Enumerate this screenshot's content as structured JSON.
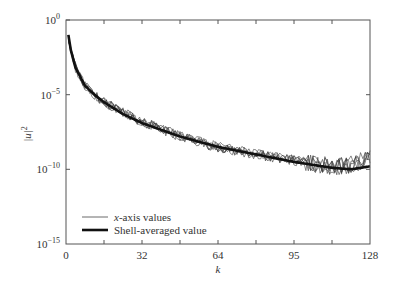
{
  "chart_data": {
    "type": "line",
    "title": "",
    "xlabel": "k",
    "ylabel": "|u|^2",
    "xlim": [
      0,
      128
    ],
    "ylim_log10": [
      -15,
      0
    ],
    "y_scale": "log",
    "grid": false,
    "legend_position": "lower left",
    "x_ticks": [
      0,
      32,
      64,
      95,
      128
    ],
    "x_tick_labels": [
      "0",
      "32",
      "64",
      "95",
      "128"
    ],
    "y_ticks_log10": [
      0,
      -5,
      -10,
      -15
    ],
    "y_tick_labels": [
      "10^0",
      "10^-5",
      "10^-10",
      "10^-15"
    ],
    "series": [
      {
        "name": "x-axis values",
        "style": "thin noisy lines (multiple realizations)",
        "k": [
          1,
          2,
          4,
          8,
          12,
          16,
          24,
          32,
          48,
          64,
          80,
          96,
          112,
          120,
          128
        ],
        "log10_value": [
          -1.2,
          -2.0,
          -3.2,
          -4.4,
          -5.0,
          -5.5,
          -6.2,
          -6.8,
          -7.8,
          -8.5,
          -9.0,
          -9.4,
          -9.8,
          -9.7,
          -9.2
        ]
      },
      {
        "name": "Shell-averaged value",
        "style": "thick line",
        "k": [
          1,
          2,
          4,
          8,
          12,
          16,
          24,
          32,
          48,
          64,
          80,
          96,
          112,
          120,
          128
        ],
        "log10_value": [
          -1.0,
          -2.0,
          -3.2,
          -4.4,
          -5.0,
          -5.5,
          -6.3,
          -6.9,
          -7.8,
          -8.5,
          -9.0,
          -9.5,
          -9.9,
          -10.0,
          -9.8
        ]
      }
    ]
  },
  "axes": {
    "xlabel": "k",
    "ylabel": "|u|",
    "ylabel_sup": "2",
    "y_ticks": [
      {
        "base": "10",
        "exp": "0"
      },
      {
        "base": "10",
        "exp": "−5"
      },
      {
        "base": "10",
        "exp": "−10"
      },
      {
        "base": "10",
        "exp": "−15"
      }
    ],
    "x_ticks": [
      "0",
      "32",
      "64",
      "95",
      "128"
    ]
  },
  "legend": {
    "items": [
      {
        "label_italic": "x",
        "label_rest": "-axis values"
      },
      {
        "label": "Shell-averaged value"
      }
    ]
  }
}
